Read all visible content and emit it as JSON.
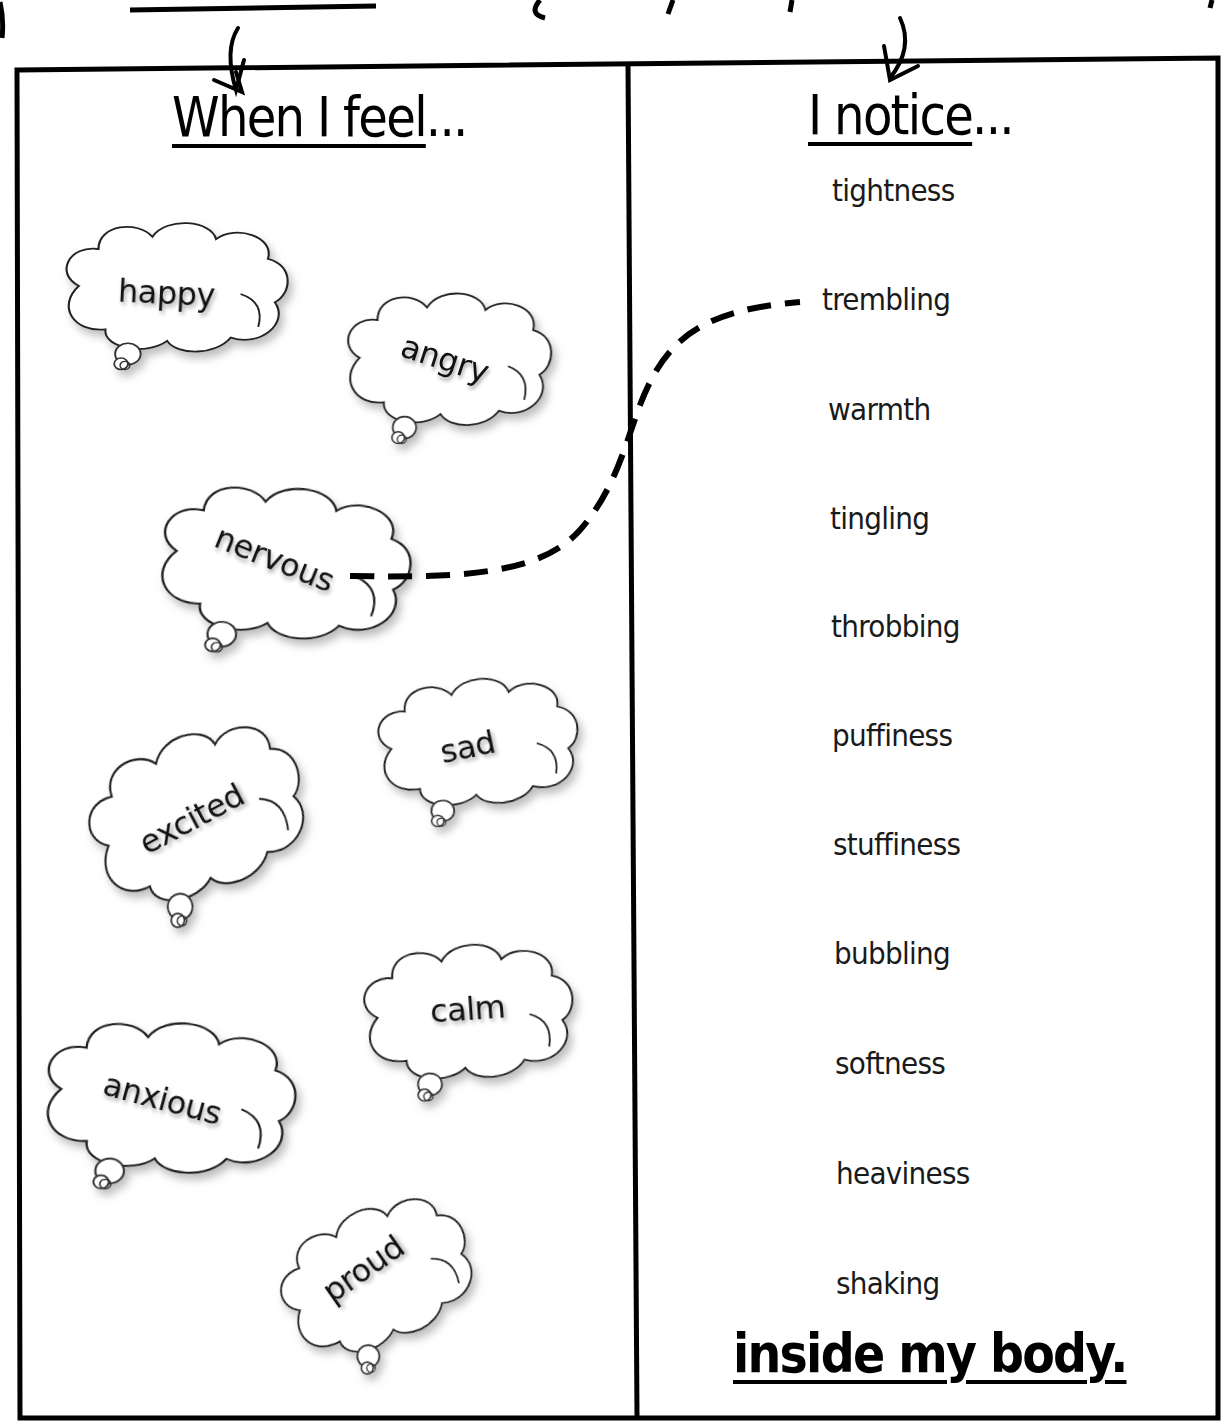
{
  "worksheet": {
    "left_column": {
      "heading": "When I feel",
      "heading_suffix": "...",
      "feelings": [
        {
          "label": "happy"
        },
        {
          "label": "angry"
        },
        {
          "label": "nervous"
        },
        {
          "label": "excited"
        },
        {
          "label": "sad"
        },
        {
          "label": "calm"
        },
        {
          "label": "anxious"
        },
        {
          "label": "proud"
        }
      ]
    },
    "right_column": {
      "heading": "I notice",
      "heading_suffix": "...",
      "sensations": [
        {
          "label": "tightness"
        },
        {
          "label": "trembling"
        },
        {
          "label": "warmth"
        },
        {
          "label": "tingling"
        },
        {
          "label": "throbbing"
        },
        {
          "label": "puffiness"
        },
        {
          "label": "stuffiness"
        },
        {
          "label": "bubbling"
        },
        {
          "label": "softness"
        },
        {
          "label": "heaviness"
        },
        {
          "label": "shaking"
        }
      ],
      "footer": "inside my body."
    },
    "connection": {
      "from": "nervous",
      "to": "trembling",
      "style": "dashed"
    },
    "colors": {
      "ink": "#000000",
      "paper": "#ffffff",
      "cloud_shadow": "#bdbdbd"
    }
  }
}
